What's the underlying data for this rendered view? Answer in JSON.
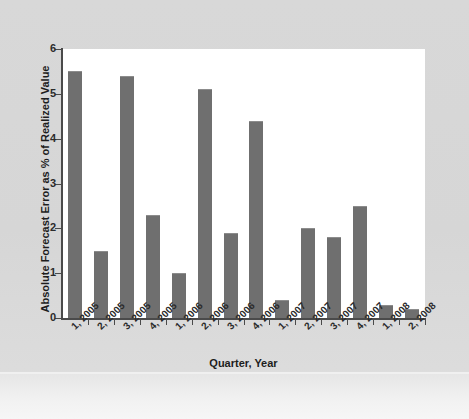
{
  "chart_data": {
    "type": "bar",
    "title": "",
    "xlabel": "Quarter, Year",
    "ylabel": "Absolute Forecast Error as % of Realized Value",
    "categories": [
      "1, 2005",
      "2, 2005",
      "3, 2005",
      "4, 2005",
      "1, 2006",
      "2, 2006",
      "3, 2006",
      "4, 2006",
      "1, 2007",
      "2, 2007",
      "3, 2007",
      "4, 2007",
      "1, 2008",
      "2, 2008"
    ],
    "values": [
      5.5,
      1.5,
      5.4,
      2.3,
      1.0,
      5.1,
      1.9,
      4.4,
      0.4,
      2.0,
      1.8,
      2.5,
      0.3,
      0.2
    ],
    "ylim": [
      0,
      6
    ],
    "ytick_labels": [
      "6",
      "5",
      "4",
      "3",
      "2",
      "1",
      "0"
    ],
    "ytick_values": [
      6,
      5,
      4,
      3,
      2,
      1,
      0
    ],
    "grid": false,
    "legend": false,
    "legend_position": "none",
    "series_name": "Absolute Forecast Error"
  },
  "style": {
    "bar_color": "#6f6f6f",
    "axis_color": "#4a4a4a",
    "plot_background": "#ffffff",
    "page_background": "#d7d7d7",
    "text_color": "#1d1d1d"
  }
}
